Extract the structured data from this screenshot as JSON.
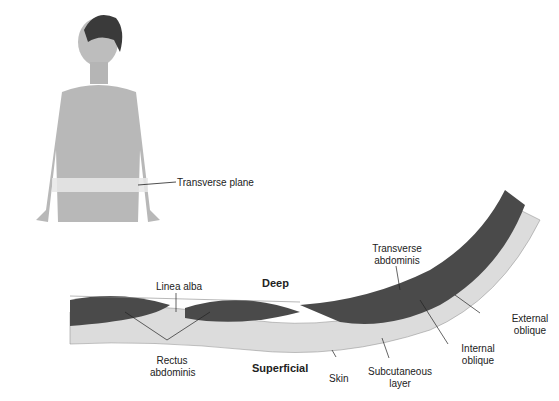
{
  "figure": {
    "plane_label": "Transverse plane"
  },
  "cross_section": {
    "orientation": {
      "top": "Deep",
      "bottom": "Superficial"
    },
    "labels": {
      "linea_alba": "Linea alba",
      "rectus_1": "Rectus",
      "rectus_2": "abdominis",
      "transverse_1": "Transverse",
      "transverse_2": "abdominis",
      "external_1": "External",
      "external_2": "oblique",
      "internal_1": "Internal",
      "internal_2": "oblique",
      "skin": "Skin",
      "subcut_1": "Subcutaneous",
      "subcut_2": "layer"
    }
  },
  "colors": {
    "muscle": "#4a4a4a",
    "fat": "#dcdcdc",
    "fascia": "#eeeeee",
    "figure": "#b8b8b8"
  }
}
